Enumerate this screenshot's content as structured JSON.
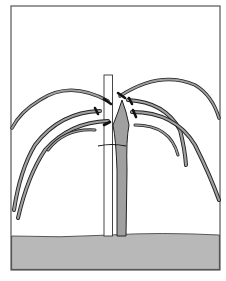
{
  "illustration": {
    "subject": "pruned plant with arching canes tied to a wooden stake",
    "colors": {
      "background": "#ffffff",
      "frame": "#555555",
      "ground": "#b8b8b8",
      "stem": "#a0a0a0",
      "outline": "#222222",
      "tie": "#111111"
    }
  }
}
